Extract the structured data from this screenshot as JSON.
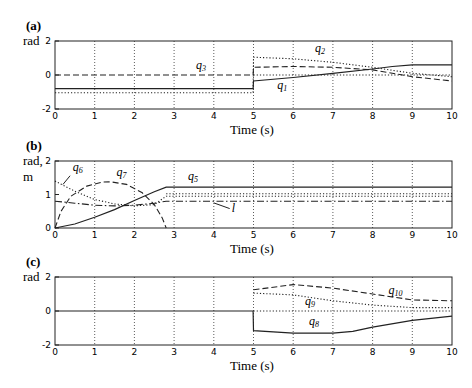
{
  "chart_data": [
    {
      "id": "a",
      "type": "line",
      "panel_label": "(a)",
      "ylabel": "rad",
      "xlabel": "Time (s)",
      "xlim": [
        0,
        10
      ],
      "ylim": [
        -2,
        2
      ],
      "xticks": [
        0,
        1,
        2,
        3,
        4,
        5,
        6,
        7,
        8,
        9,
        10
      ],
      "yticks": [
        -2,
        0,
        2
      ],
      "grid": "vertical-dotted",
      "series": [
        {
          "name": "q1",
          "style": "solid",
          "x": [
            0,
            4.99,
            5,
            6,
            7,
            8,
            8.5,
            9,
            10
          ],
          "y": [
            -0.8,
            -0.8,
            -0.35,
            -0.15,
            0.1,
            0.35,
            0.5,
            0.6,
            0.6
          ]
        },
        {
          "name": "q2",
          "style": "dotted",
          "x": [
            0,
            4.99,
            5,
            6,
            7,
            8,
            9,
            10
          ],
          "y": [
            -1.05,
            -1.05,
            1.05,
            0.95,
            0.75,
            0.45,
            0.1,
            -0.1
          ]
        },
        {
          "name": "q3",
          "style": "dashed",
          "x": [
            0,
            4.99,
            5,
            6,
            7,
            8,
            9,
            10
          ],
          "y": [
            0,
            0,
            0.45,
            0.5,
            0.45,
            0.3,
            -0.1,
            -0.35
          ]
        },
        {
          "name": "ref",
          "style": "dotted",
          "x": [
            5,
            10
          ],
          "y": [
            0,
            0
          ]
        }
      ],
      "annotations": [
        {
          "text": "q",
          "sub": "3",
          "x": 3.55,
          "y": 0.35
        },
        {
          "text": "q",
          "sub": "2",
          "x": 6.55,
          "y": 1.35
        },
        {
          "text": "q",
          "sub": "1",
          "x": 5.6,
          "y": -0.85
        }
      ]
    },
    {
      "id": "b",
      "type": "line",
      "panel_label": "(b)",
      "ylabel": "rad,",
      "ylabel2": "m",
      "xlabel": "Time (s)",
      "xlim": [
        0,
        10
      ],
      "ylim": [
        0,
        2
      ],
      "xticks": [
        0,
        1,
        2,
        3,
        4,
        5,
        6,
        7,
        8,
        9,
        10
      ],
      "yticks": [
        0,
        1,
        2
      ],
      "grid": "vertical-dotted",
      "series": [
        {
          "name": "q5",
          "style": "solid",
          "x": [
            0,
            0.5,
            1,
            1.5,
            2,
            2.5,
            2.8,
            10
          ],
          "y": [
            0,
            0.12,
            0.32,
            0.55,
            0.82,
            1.08,
            1.22,
            1.22
          ]
        },
        {
          "name": "q6",
          "style": "dotted",
          "x": [
            0,
            0.5,
            1,
            1.5,
            2,
            2.5,
            2.8,
            10
          ],
          "y": [
            1.4,
            1.1,
            0.85,
            0.72,
            0.66,
            0.7,
            0.95,
            0.95
          ]
        },
        {
          "name": "q6b",
          "style": "dotted",
          "x": [
            2.8,
            10
          ],
          "y": [
            1.02,
            1.02
          ]
        },
        {
          "name": "q7",
          "style": "dashed",
          "x": [
            0,
            0.15,
            0.4,
            0.8,
            1.2,
            1.4,
            1.8,
            2.2,
            2.5,
            2.7,
            2.8
          ],
          "y": [
            0,
            0.5,
            0.95,
            1.25,
            1.37,
            1.38,
            1.3,
            1.05,
            0.7,
            0.3,
            0
          ]
        },
        {
          "name": "l",
          "style": "dashdot",
          "x": [
            0,
            0.5,
            1,
            1.5,
            2,
            2.5,
            2.8,
            10
          ],
          "y": [
            0.8,
            0.74,
            0.68,
            0.66,
            0.68,
            0.74,
            0.8,
            0.8
          ]
        }
      ],
      "annotations": [
        {
          "text": "q",
          "sub": "6",
          "x": 0.45,
          "y": 1.7,
          "leader": [
            [
              0.38,
              1.56
            ],
            [
              0.2,
              1.3
            ]
          ]
        },
        {
          "text": "q",
          "sub": "7",
          "x": 1.55,
          "y": 1.55
        },
        {
          "text": "q",
          "sub": "5",
          "x": 3.35,
          "y": 1.42
        },
        {
          "text": "l",
          "sub": "",
          "x": 4.45,
          "y": 0.48,
          "leader": [
            [
              4.4,
              0.58
            ],
            [
              4.0,
              0.75
            ]
          ]
        }
      ]
    },
    {
      "id": "c",
      "type": "line",
      "panel_label": "(c)",
      "ylabel": "rad",
      "xlabel": "Time (s)",
      "xlim": [
        0,
        10
      ],
      "ylim": [
        -2,
        2
      ],
      "xticks": [
        0,
        1,
        2,
        3,
        4,
        5,
        6,
        7,
        8,
        9,
        10
      ],
      "yticks": [
        -2,
        0,
        2
      ],
      "grid": "vertical-dotted",
      "series": [
        {
          "name": "q8",
          "style": "solid",
          "x": [
            0,
            4.99,
            5,
            6,
            7,
            7.5,
            8,
            9,
            10
          ],
          "y": [
            0,
            0,
            -1.15,
            -1.3,
            -1.3,
            -1.2,
            -0.95,
            -0.55,
            -0.3
          ]
        },
        {
          "name": "q9",
          "style": "dotted",
          "x": [
            5,
            6,
            7,
            8,
            9,
            10
          ],
          "y": [
            1.05,
            0.95,
            0.6,
            0.35,
            0.2,
            0.2
          ]
        },
        {
          "name": "q10",
          "style": "dashed",
          "x": [
            5,
            6,
            7,
            8,
            9,
            10
          ],
          "y": [
            1.25,
            1.55,
            1.35,
            1.0,
            0.65,
            0.6
          ]
        },
        {
          "name": "ref",
          "style": "dotted",
          "x": [
            5,
            10
          ],
          "y": [
            0,
            0
          ]
        }
      ],
      "annotations": [
        {
          "text": "q",
          "sub": "10",
          "x": 8.4,
          "y": 1.0
        },
        {
          "text": "q",
          "sub": "9",
          "x": 6.3,
          "y": 0.35
        },
        {
          "text": "q",
          "sub": "8",
          "x": 6.4,
          "y": -0.85
        }
      ]
    }
  ],
  "layout": {
    "panels": [
      {
        "plot_left": 55,
        "plot_right": 452,
        "plot_top": 41,
        "plot_bottom": 109
      },
      {
        "plot_left": 55,
        "plot_right": 452,
        "plot_top": 161,
        "plot_bottom": 228
      },
      {
        "plot_left": 55,
        "plot_right": 452,
        "plot_top": 277,
        "plot_bottom": 345
      }
    ]
  }
}
